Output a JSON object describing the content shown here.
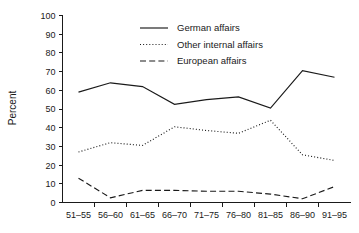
{
  "chart_data": {
    "type": "line",
    "title": "",
    "subtitle": "",
    "xlabel": "",
    "ylabel": "Percent",
    "categories": [
      "51–55",
      "56–60",
      "61–65",
      "66–70",
      "71–75",
      "76–80",
      "81–85",
      "86–90",
      "91–95"
    ],
    "ylim": [
      0,
      100
    ],
    "yticks": [
      "0",
      "10",
      "20",
      "30",
      "40",
      "50",
      "60",
      "70",
      "80",
      "90",
      "100"
    ],
    "ytick_values": [
      0,
      10,
      20,
      30,
      40,
      50,
      60,
      70,
      80,
      90,
      100
    ],
    "grid": false,
    "legend_position": "top-center",
    "series": [
      {
        "name": "German affairs",
        "style": "solid",
        "values": [
          59,
          64,
          62,
          52.5,
          55,
          56.5,
          50.5,
          70.5,
          67
        ]
      },
      {
        "name": "Other internal affairs",
        "style": "dotted",
        "values": [
          27,
          32,
          30.5,
          40.5,
          38.5,
          37,
          44,
          25.5,
          22.5
        ]
      },
      {
        "name": "European affairs",
        "style": "dashed",
        "values": [
          13,
          2.5,
          6.5,
          6.5,
          6,
          6,
          4.5,
          2,
          8.5
        ]
      }
    ]
  },
  "legend": {
    "items": [
      {
        "label": "German affairs",
        "style": "solid"
      },
      {
        "label": "Other internal affairs",
        "style": "dotted"
      },
      {
        "label": "European affairs",
        "style": "dashed"
      }
    ]
  },
  "colors": {
    "line": "#1a1a1a",
    "axis": "#1a1a1a",
    "background": "#ffffff"
  }
}
